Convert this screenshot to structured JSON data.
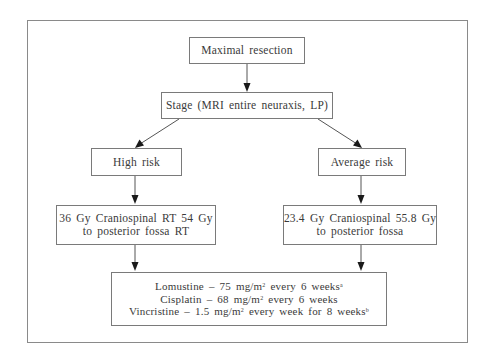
{
  "diagram": {
    "type": "flowchart",
    "nodes": {
      "resection": {
        "label": "Maximal resection"
      },
      "stage": {
        "label": "Stage (MRI entire neuraxis, LP)"
      },
      "high_risk": {
        "label": "High risk"
      },
      "average_risk": {
        "label": "Average risk"
      },
      "high_risk_dose": {
        "lines": [
          "36 Gy Craniospinal RT 54 Gy",
          "to posterior fossa RT"
        ]
      },
      "average_risk_dose": {
        "lines": [
          "23.4 Gy Craniospinal 55.8 Gy",
          "to posterior fossa"
        ]
      },
      "chemotherapy": {
        "lines": [
          {
            "drug": "Lomustine",
            "dash": "–",
            "dose": "75 mg/m",
            "exp": "2",
            "schedule": "every 6 weeks",
            "footnote": "a"
          },
          {
            "drug": "Cisplatin",
            "dash": "–",
            "dose": "68 mg/m",
            "exp": "2",
            "schedule": "every 6 weeks",
            "footnote": ""
          },
          {
            "drug": "Vincristine",
            "dash": "–",
            "dose": "1.5 mg/m",
            "exp": "2",
            "schedule": "every week for 8 weeks",
            "footnote": "b"
          }
        ]
      }
    },
    "edges": [
      {
        "from": "resection",
        "to": "stage"
      },
      {
        "from": "stage",
        "to": "high_risk"
      },
      {
        "from": "stage",
        "to": "average_risk"
      },
      {
        "from": "high_risk",
        "to": "high_risk_dose"
      },
      {
        "from": "average_risk",
        "to": "average_risk_dose"
      },
      {
        "from": "high_risk_dose",
        "to": "chemotherapy"
      },
      {
        "from": "average_risk_dose",
        "to": "chemotherapy"
      }
    ]
  }
}
